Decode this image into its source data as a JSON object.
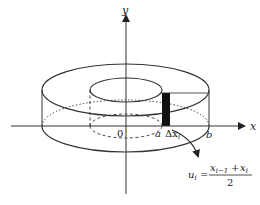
{
  "diagram": {
    "axes": {
      "x_label": "x",
      "y_label": "y",
      "origin_label": "0"
    },
    "points": {
      "a_label": "a",
      "b_label": "b",
      "delta_label": "Δx",
      "delta_sub": "i"
    },
    "formula": {
      "lhs": "u",
      "lhs_sub": "i",
      "equals": "=",
      "num_left": "x",
      "num_left_sub": "i−1",
      "plus": "+",
      "num_right": "x",
      "num_right_sub": "i",
      "denominator": "2"
    },
    "colors": {
      "line": "#333333",
      "strip": "#111111",
      "background": "#ffffff"
    }
  }
}
